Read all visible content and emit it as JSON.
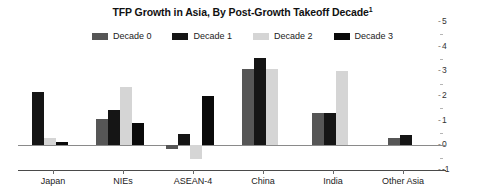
{
  "chart_data": {
    "type": "bar",
    "title": "TFP Growth in Asia, By Post-Growth Takeoff Decade",
    "title_footnote": "1",
    "xlabel": "",
    "ylabel": "",
    "ylim": [
      -1,
      5
    ],
    "yticks": [
      -1,
      0,
      1,
      2,
      3,
      4,
      5
    ],
    "ytick_labels": [
      "-1",
      "0",
      "1",
      "2",
      "3",
      "4",
      "5"
    ],
    "y_axis_position": "right",
    "grid": false,
    "legend_position": "top-center",
    "categories": [
      "Japan",
      "NIEs",
      "ASEAN-4",
      "China",
      "India",
      "Other Asia"
    ],
    "series": [
      {
        "name": "Decade 0",
        "color": "#565656",
        "values": [
          null,
          1.05,
          -0.15,
          3.1,
          1.3,
          0.3
        ]
      },
      {
        "name": "Decade 1",
        "color": "#151515",
        "values": [
          2.15,
          1.45,
          0.45,
          3.55,
          1.3,
          0.4
        ]
      },
      {
        "name": "Decade 2",
        "color": "#d5d5d5",
        "values": [
          0.3,
          2.35,
          -0.55,
          3.1,
          3.0,
          null
        ]
      },
      {
        "name": "Decade 3",
        "color": "#0a0a0a",
        "values": [
          0.15,
          0.9,
          2.0,
          null,
          null,
          null
        ]
      }
    ]
  },
  "axis": {
    "y_labels": [
      "5",
      "4",
      "3",
      "2",
      "1",
      "0",
      "-1"
    ]
  },
  "legend": {
    "items": [
      {
        "label": "Decade 0",
        "color": "#565656"
      },
      {
        "label": "Decade 1",
        "color": "#151515"
      },
      {
        "label": "Decade 2",
        "color": "#d5d5d5"
      },
      {
        "label": "Decade 3",
        "color": "#0a0a0a"
      }
    ]
  }
}
